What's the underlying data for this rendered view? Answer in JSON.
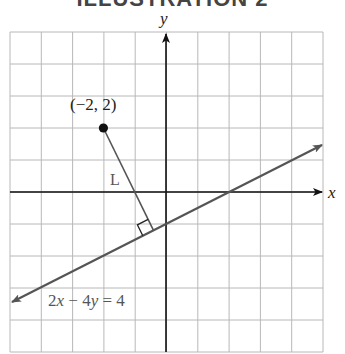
{
  "title": "ILLUSTRATION 2",
  "chart_data": {
    "type": "line",
    "title": "ILLUSTRATION 2",
    "xlabel": "x",
    "ylabel": "y",
    "xlim": [
      -5,
      5
    ],
    "ylim": [
      -5,
      5
    ],
    "grid": true,
    "grid_step": 1,
    "tick_labels_shown": false,
    "series": [
      {
        "name": "2x − 4y = 4",
        "equation": "2x - 4y = 4",
        "slope": 0.5,
        "intercept": -1,
        "arrows_both_ends": true,
        "x": [
          -5,
          5
        ],
        "y": [
          -3.5,
          1.5
        ]
      },
      {
        "name": "L",
        "type": "segment",
        "x": [
          -2,
          -0.4
        ],
        "y": [
          2,
          -1.2
        ],
        "note": "perpendicular distance from point to line"
      }
    ],
    "points": [
      {
        "label": "(−2, 2)",
        "x": -2,
        "y": 2
      }
    ],
    "annotations": [
      {
        "text": "(−2, 2)",
        "x": -2,
        "y": 2
      },
      {
        "text": "L",
        "near": "perpendicular segment"
      },
      {
        "text": "2x − 4y = 4",
        "near": "lower-left of line"
      },
      {
        "text": "right-angle marker",
        "x": -0.4,
        "y": -1.2
      }
    ]
  },
  "labels": {
    "point": "(−2, 2)",
    "segment": "L",
    "equation_a": "2",
    "equation_x": "x",
    "equation_mid": " − 4",
    "equation_y": "y",
    "equation_end": " = 4",
    "x_axis": "x",
    "y_axis": "y"
  }
}
